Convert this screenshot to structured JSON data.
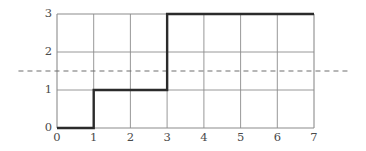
{
  "chart_data": {
    "type": "line",
    "subtype": "step-post",
    "title": "",
    "subtitle": "",
    "xlabel": "",
    "ylabel": "",
    "xlim": [
      0,
      7
    ],
    "ylim": [
      0,
      3
    ],
    "xticks": [
      0,
      1,
      2,
      3,
      4,
      5,
      6,
      7
    ],
    "xtick_labels": [
      "0",
      "1",
      "2",
      "3",
      "4",
      "5",
      "6",
      "7"
    ],
    "yticks": [
      0,
      1,
      2,
      3
    ],
    "ytick_labels": [
      "0",
      "1",
      "2",
      "3"
    ],
    "grid": true,
    "grid_color": "#8c8c8c",
    "legend": null,
    "legend_position": "none",
    "series": [
      {
        "name": "step-curve",
        "color": "#2b2b2b",
        "line_width": 2.4,
        "style": "solid",
        "steps": [
          {
            "x_start": 0,
            "x_end": 1,
            "y": 0
          },
          {
            "x_start": 1,
            "x_end": 3,
            "y": 1
          },
          {
            "x_start": 3,
            "x_end": 7,
            "y": 3
          }
        ],
        "x": [
          0,
          1,
          1,
          3,
          3,
          7
        ],
        "y": [
          0,
          0,
          1,
          1,
          3,
          3
        ]
      }
    ],
    "annotations": [
      {
        "name": "threshold-line",
        "type": "hline",
        "y": 1.5,
        "style": "dashed",
        "color": "#6e6e6e",
        "line_width": 1.2,
        "dash_pattern": "5 4",
        "x_start": -1.05,
        "x_end": 8.0,
        "label": ""
      }
    ]
  },
  "axes": {
    "x_axis_name": "x-axis",
    "y_axis_name": "y-axis",
    "frame": true
  }
}
